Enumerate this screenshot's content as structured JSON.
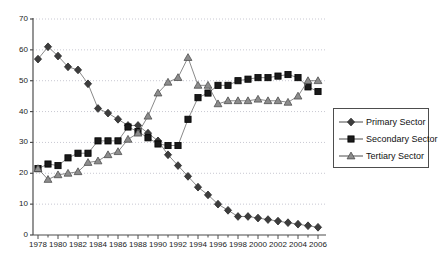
{
  "chart_data": {
    "type": "line",
    "title": "",
    "subtitle": "",
    "xlabel": "",
    "ylabel": "",
    "xlim": [
      1977.5,
      2006.8
    ],
    "ylim": [
      0,
      70
    ],
    "ytick_step": 10,
    "yticks": [
      "0",
      "10",
      "20",
      "30",
      "40",
      "50",
      "60",
      "70"
    ],
    "xticks": [
      "1978",
      "1980",
      "1982",
      "1984",
      "1986",
      "1988",
      "1990",
      "1992",
      "1994",
      "1996",
      "1998",
      "2000",
      "2002",
      "2004",
      "2006"
    ],
    "x": [
      1978,
      1979,
      1980,
      1981,
      1982,
      1983,
      1984,
      1985,
      1986,
      1987,
      1988,
      1989,
      1990,
      1991,
      1992,
      1993,
      1994,
      1995,
      1996,
      1997,
      1998,
      1999,
      2000,
      2001,
      2002,
      2003,
      2004,
      2005,
      2006
    ],
    "grid": "horizontal-dotted",
    "legend_position": "right-middle",
    "series": [
      {
        "name": "Primary Sector",
        "marker": "diamond",
        "color": "#3d3d3d",
        "values": [
          57,
          61,
          58,
          54.5,
          53.5,
          49,
          41,
          39.5,
          37.5,
          35.5,
          35.5,
          33,
          30.5,
          26,
          22.5,
          19,
          15.5,
          13,
          10,
          8,
          6,
          6,
          5.5,
          5,
          4.5,
          4,
          3.5,
          3,
          2.5
        ]
      },
      {
        "name": "Secondary Sector",
        "marker": "square",
        "color": "#1a1a1a",
        "values": [
          21.5,
          23,
          22.5,
          25,
          26.5,
          26.5,
          30.5,
          30.5,
          30.5,
          35,
          33.5,
          31.5,
          29.5,
          29,
          29,
          37.5,
          44.5,
          46,
          48.5,
          48.5,
          50,
          50.5,
          51,
          51,
          51.5,
          52,
          51,
          48,
          46.5
        ]
      },
      {
        "name": "Tertiary Sector",
        "marker": "triangle",
        "color": "#8c8c8c",
        "values": [
          21.5,
          18,
          19.5,
          20,
          20.5,
          23.5,
          24,
          26,
          27,
          31,
          33,
          38.5,
          46,
          49.5,
          51,
          57.5,
          48.5,
          48.5,
          42.5,
          43.5,
          43.5,
          43.5,
          44,
          43.5,
          43.5,
          43,
          45,
          50,
          50
        ]
      }
    ]
  },
  "legend": {
    "items": [
      {
        "label": "Primary Sector",
        "marker": "diamond"
      },
      {
        "label": "Secondary Sector",
        "marker": "square"
      },
      {
        "label": "Tertiary Sector",
        "marker": "triangle"
      }
    ]
  },
  "colors": {
    "primary": "#3d3d3d",
    "secondary": "#1a1a1a",
    "tertiary": "#8c8c8c",
    "axis": "#4d4d4d",
    "grid": "#c8c8d2",
    "text": "#1a1a1a",
    "background": "#ffffff"
  }
}
